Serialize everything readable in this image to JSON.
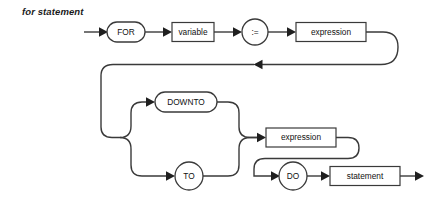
{
  "diagram": {
    "title": "for statement",
    "type": "railroad-syntax-diagram",
    "colors": {
      "line": "#3a3a3a",
      "text": "#111111",
      "background": "#ffffff",
      "arrow": "#1f1f1f"
    },
    "nodes": [
      {
        "id": "for",
        "label": "FOR",
        "shape": "oval",
        "kind": "terminal",
        "cx": 126,
        "cy": 32,
        "w": 38,
        "h": 20
      },
      {
        "id": "variable",
        "label": "variable",
        "shape": "rectangle",
        "kind": "nonterminal",
        "cx": 193,
        "cy": 32,
        "w": 42,
        "h": 19
      },
      {
        "id": "assign",
        "label": ":=",
        "shape": "circle",
        "kind": "terminal",
        "cx": 255,
        "cy": 32,
        "w": 26,
        "h": 26
      },
      {
        "id": "expr-top",
        "label": "expression",
        "shape": "rectangle",
        "kind": "nonterminal",
        "cx": 331,
        "cy": 32,
        "w": 70,
        "h": 19
      },
      {
        "id": "downto",
        "label": "DOWNTO",
        "shape": "oval",
        "kind": "terminal",
        "cx": 186,
        "cy": 102,
        "w": 62,
        "h": 20
      },
      {
        "id": "to",
        "label": "TO",
        "shape": "circle",
        "kind": "terminal",
        "cx": 189,
        "cy": 176,
        "w": 28,
        "h": 28
      },
      {
        "id": "expr-mid",
        "label": "expression",
        "shape": "rectangle",
        "kind": "nonterminal",
        "cx": 301,
        "cy": 134,
        "w": 70,
        "h": 19
      },
      {
        "id": "do",
        "label": "DO",
        "shape": "circle",
        "kind": "terminal",
        "cx": 293,
        "cy": 176,
        "w": 28,
        "h": 28
      },
      {
        "id": "statement",
        "label": "statement",
        "shape": "rectangle",
        "kind": "nonterminal",
        "cx": 365,
        "cy": 176,
        "w": 70,
        "h": 19
      }
    ],
    "sequence": [
      "FOR",
      "variable",
      ":=",
      "expression",
      "DOWNTO | TO",
      "expression",
      "DO",
      "statement"
    ],
    "branches": [
      {
        "name": "direction-choice",
        "options": [
          "DOWNTO",
          "TO"
        ]
      }
    ]
  }
}
